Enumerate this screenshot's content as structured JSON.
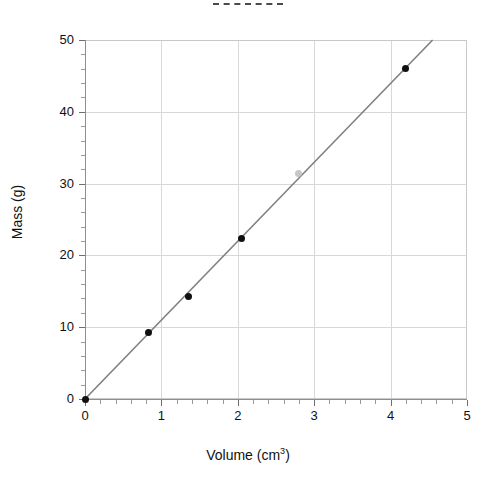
{
  "chart_data": {
    "type": "scatter",
    "title": "",
    "title_marker": "dashed-line",
    "xlabel": "Volume (cm",
    "xlabel_sup": "3",
    "xlabel_close": ")",
    "ylabel": "Mass (g)",
    "xlim": [
      0,
      5
    ],
    "ylim": [
      0,
      50
    ],
    "grid": true,
    "legend": "none",
    "x_ticks": [
      0,
      1,
      2,
      3,
      4,
      5
    ],
    "x_tick_labels": [
      "0",
      "1",
      "2",
      "3",
      "4",
      "5"
    ],
    "x_minor_step": 0.2,
    "y_ticks": [
      0,
      10,
      20,
      30,
      40,
      50
    ],
    "y_tick_labels": [
      "0",
      "10",
      "20",
      "30",
      "40",
      "50"
    ],
    "y_minor_step": 2,
    "series": [
      {
        "name": "measurements",
        "marker_color": "#101010",
        "points": [
          {
            "x": 0.0,
            "y": 0.0,
            "faint": false
          },
          {
            "x": 0.83,
            "y": 9.2,
            "faint": false
          },
          {
            "x": 1.35,
            "y": 14.3,
            "faint": false
          },
          {
            "x": 2.05,
            "y": 22.4,
            "faint": false
          },
          {
            "x": 2.8,
            "y": 31.4,
            "faint": true
          },
          {
            "x": 4.2,
            "y": 46.0,
            "faint": false
          }
        ]
      },
      {
        "name": "best-fit-line",
        "line_color": "#808080",
        "slope": 11.0,
        "intercept": 0.0,
        "x_start": 0.0,
        "y_start": 0.0,
        "x_end": 4.55,
        "y_end": 50.0
      }
    ]
  },
  "colors": {
    "background": "#ffffff",
    "grid": "#d8d8d8",
    "axis": "#8e8e8e",
    "frame": "#c9c9c9",
    "marker": "#101010",
    "marker_faint": "#bdbdbd",
    "fit_line": "#808080",
    "text": "#111111"
  }
}
